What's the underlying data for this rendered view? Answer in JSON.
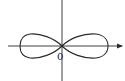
{
  "diagram": {
    "type": "lemniscate-figure-eight",
    "origin_label": "0",
    "colors": {
      "stroke": "#2a2a2a",
      "background": "#ffffff"
    },
    "geometry": {
      "origin": [
        62,
        46
      ],
      "x_axis": {
        "x1": 8,
        "x2": 122,
        "y": 46,
        "arrow": "right"
      },
      "y_axis": {
        "x": 62,
        "y1": 0,
        "y2": 81,
        "arrow": "none"
      },
      "left_lobe_extent_x": 20,
      "right_lobe_extent_x": 108,
      "lobe_half_height": 12
    }
  }
}
